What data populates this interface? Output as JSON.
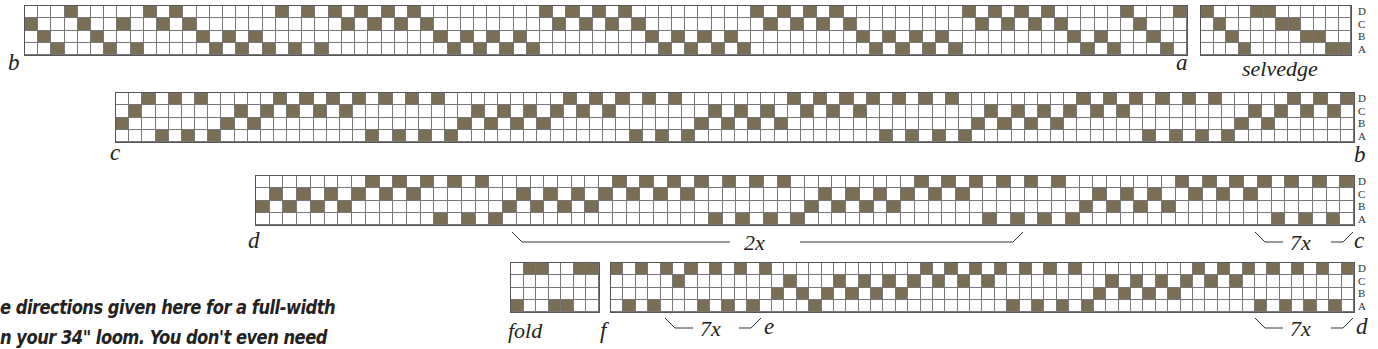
{
  "colors": {
    "filled": "#7a6e55",
    "grid_line": "#777777",
    "background": "#ffffff",
    "text": "#222222"
  },
  "shafts": [
    "D",
    "C",
    "B",
    "A"
  ],
  "rows": [
    {
      "id": "row1",
      "start_label": "b",
      "end_label": "a",
      "threading": "CBADCBACADCDCBABABADADADCDCDCDCBABABABADCDCDCDCBABABABADCDCDCDCBABABABADCDCDCDCBABADCBAD",
      "extra": {
        "name": "selvedge",
        "label": "selvedge",
        "threading": "DCBADDCCBBAA"
      }
    },
    {
      "id": "row2",
      "start_label": "c",
      "end_label": "b",
      "threading": "BCDADADABCBCDCDCDCDADADADABCBCBCBCDCDCDADADABCBCBCBDCDCDCDADADADABCBCBCBCDCDCDADADADABCBCDCDCD"
    },
    {
      "id": "row3",
      "start_label": "d",
      "end_label": "c",
      "repeats": [
        {
          "label": "2x"
        },
        {
          "label": "7x"
        }
      ],
      "threading": "BCBCBCBCDCDCDADADABCBCBCBCDCDCDCDADADADABCBCBCBCDCDCDADADADABCBCBCBDCDCDCDADADAD"
    },
    {
      "id": "row4",
      "start_label": "f",
      "end_label": "d",
      "repeats": [
        {
          "label": "7x",
          "end_label": "e"
        },
        {
          "label": "7x"
        }
      ],
      "extra": {
        "name": "fold",
        "label": "fold",
        "threading": "ADDAADD"
      },
      "threading": "DADADCDADADADBCBABCBCBCBCDCDCDCDADADADABCBCBCBCDCDCDADADADAD"
    }
  ],
  "note_lines": [
    "e directions given here for a full-width",
    "n your 34\" loom. You don't even need"
  ]
}
